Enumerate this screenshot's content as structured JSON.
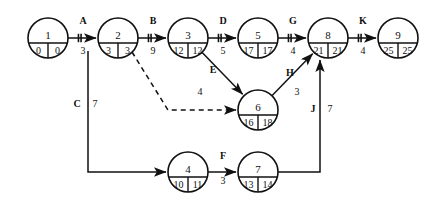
{
  "diagram": {
    "type": "cpm-network-diagram",
    "title": "",
    "nodes": [
      {
        "id": "n1",
        "label": "1",
        "early": "0",
        "late": "0",
        "cx": 48,
        "cy": 38
      },
      {
        "id": "n2",
        "label": "2",
        "early": "3",
        "late": "3",
        "cx": 118,
        "cy": 38
      },
      {
        "id": "n3",
        "label": "3",
        "early": "12",
        "late": "12",
        "cx": 188,
        "cy": 38
      },
      {
        "id": "n5",
        "label": "5",
        "early": "17",
        "late": "17",
        "cx": 258,
        "cy": 38
      },
      {
        "id": "n8",
        "label": "8",
        "early": "21",
        "late": "21",
        "cx": 328,
        "cy": 38
      },
      {
        "id": "n9",
        "label": "9",
        "early": "25",
        "late": "25",
        "cx": 398,
        "cy": 38
      },
      {
        "id": "n6",
        "label": "6",
        "early": "16",
        "late": "18",
        "cx": 258,
        "cy": 110
      },
      {
        "id": "n4",
        "label": "4",
        "early": "10",
        "late": "11",
        "cx": 188,
        "cy": 172
      },
      {
        "id": "n7",
        "label": "7",
        "early": "13",
        "late": "14",
        "cx": 258,
        "cy": 172
      }
    ],
    "edges": [
      {
        "id": "A",
        "label": "A",
        "duration": "3",
        "from": "n1",
        "to": "n2",
        "critical": true,
        "dummy": false,
        "lx": 83,
        "ly": 24,
        "vx": 83,
        "vy": 54
      },
      {
        "id": "B",
        "label": "B",
        "duration": "9",
        "from": "n2",
        "to": "n3",
        "critical": true,
        "dummy": false,
        "lx": 153,
        "ly": 24,
        "vx": 153,
        "vy": 54
      },
      {
        "id": "D",
        "label": "D",
        "duration": "5",
        "from": "n3",
        "to": "n5",
        "critical": true,
        "dummy": false,
        "lx": 223,
        "ly": 24,
        "vx": 223,
        "vy": 54
      },
      {
        "id": "G",
        "label": "G",
        "duration": "4",
        "from": "n5",
        "to": "n8",
        "critical": true,
        "dummy": false,
        "lx": 293,
        "ly": 24,
        "vx": 293,
        "vy": 54
      },
      {
        "id": "K",
        "label": "K",
        "duration": "4",
        "from": "n8",
        "to": "n9",
        "critical": true,
        "dummy": false,
        "lx": 363,
        "ly": 24,
        "vx": 363,
        "vy": 54
      },
      {
        "id": "C",
        "label": "C",
        "duration": "7",
        "from": "n2",
        "to": "n4",
        "critical": false,
        "dummy": false,
        "lx": 77,
        "ly": 107,
        "vx": 95,
        "vy": 107
      },
      {
        "id": "E",
        "label": "E",
        "duration": "4",
        "from": "n3",
        "to": "n6",
        "critical": false,
        "dummy": false,
        "lx": 213,
        "ly": 73,
        "vx": 200,
        "vy": 95
      },
      {
        "id": "F",
        "label": "F",
        "duration": "3",
        "from": "n4",
        "to": "n7",
        "critical": false,
        "dummy": false,
        "lx": 223,
        "ly": 159,
        "vx": 223,
        "vy": 184
      },
      {
        "id": "H",
        "label": "H",
        "duration": "3",
        "from": "n6",
        "to": "n8",
        "critical": false,
        "dummy": false,
        "lx": 290,
        "ly": 76,
        "vx": 297,
        "vy": 95
      },
      {
        "id": "J",
        "label": "J",
        "duration": "7",
        "from": "n7",
        "to": "n8",
        "critical": false,
        "dummy": false,
        "lx": 313,
        "ly": 112,
        "vx": 330,
        "vy": 112
      },
      {
        "id": "dummy",
        "label": "",
        "duration": "",
        "from": "n2",
        "to": "n6",
        "critical": false,
        "dummy": true,
        "lx": 0,
        "ly": 0,
        "vx": 0,
        "vy": 0
      }
    ]
  }
}
